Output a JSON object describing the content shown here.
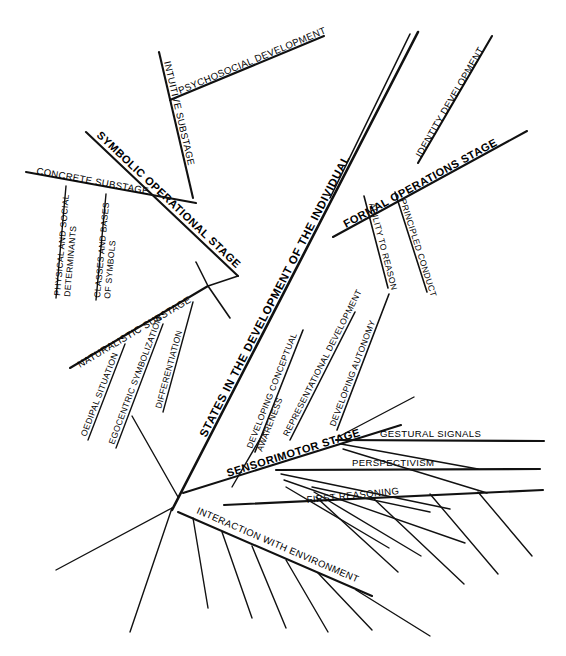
{
  "diagram": {
    "type": "fishbone-hierarchy",
    "title": "STATES IN THE DEVELOPMENT OF THE INDIVIDUAL",
    "background_color": "#ffffff",
    "line_color": "#111111",
    "text_color": "#000000",
    "spine": {
      "label": "STATES IN THE DEVELOPMENT OF THE INDIVIDUAL"
    },
    "stages": [
      {
        "id": "symbolic-operational-stage",
        "label": "SYMBOLIC OPERATIONAL STAGE",
        "side": "upper-left",
        "substages": [
          {
            "id": "concrete-substage",
            "label": "CONCRETE SUBSTAGE",
            "items": [
              {
                "id": "physical-and-social-determinants",
                "label": "PHYSICAL AND SOCIAL",
                "label2": "DETERMINANTS"
              },
              {
                "id": "classes-and-bases-of-symbols",
                "label": "CLASSES AND BASES",
                "label2": "OF SYMBOLS"
              }
            ]
          },
          {
            "id": "naturalistic-substage",
            "label": "NATURALISTIC SUBSTAGE",
            "items": [
              {
                "id": "oedipal-situation",
                "label": "OEDIPAL SITUATION"
              },
              {
                "id": "egocentric-symbolization",
                "label": "EGOCENTRIC SYMBOLIZATION"
              },
              {
                "id": "differentiation",
                "label": "DIFFERENTIATION"
              }
            ]
          },
          {
            "id": "intuitive-substage",
            "label": "INTUITIVE SUBSTAGE",
            "items": [
              {
                "id": "psychosocial-development",
                "label": "PSYCHOSOCIAL DEVELOPMENT"
              }
            ]
          }
        ]
      },
      {
        "id": "formal-operations-stage",
        "label": "FORMAL OPERATIONS STAGE",
        "side": "upper-right",
        "substages": [
          {
            "id": "identity-development",
            "label": "IDENTITY DEVELOPMENT",
            "items": []
          },
          {
            "id": "principled-conduct",
            "label": "PRINCIPLED CONDUCT",
            "items": []
          },
          {
            "id": "ability-to-reason",
            "label": "ABILITY TO REASON",
            "items": []
          }
        ]
      },
      {
        "id": "sensorimotor-stage",
        "label": "SENSORIMOTOR STAGE",
        "side": "lower-right",
        "substages": [
          {
            "id": "gestural-signals",
            "label": "GESTURAL SIGNALS",
            "items": []
          },
          {
            "id": "perspectivism",
            "label": "PERSPECTIVISM",
            "items": []
          },
          {
            "id": "first-reasoning",
            "label": "FIRST REASONING",
            "items": []
          },
          {
            "id": "interaction-with-environment",
            "label": "INTERACTION WITH ENVIRONMENT",
            "items": []
          }
        ]
      }
    ],
    "mid-branches": [
      {
        "id": "developing-conceptual-awareness",
        "label": "DEVELOPING CONCEPTUAL",
        "label2": "AWARENESS"
      },
      {
        "id": "representational-development",
        "label": "REPRESENTATIONAL DEVELOPMENT"
      },
      {
        "id": "developing-autonomy",
        "label": "DEVELOPING AUTONOMY"
      }
    ]
  }
}
